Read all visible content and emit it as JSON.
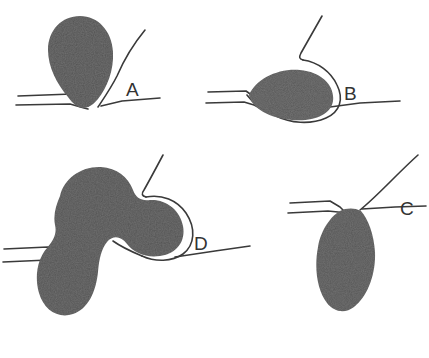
{
  "figure": {
    "background_color": "#ffffff",
    "ink_color": "#2b2b2b",
    "line_color": "#3a3a3a",
    "panels": [
      {
        "id": "panel-a",
        "label": "A",
        "label_x": 126,
        "label_y": 96,
        "description": "Teardrop body above membrane, narrow end contacting a pinched pore"
      },
      {
        "id": "panel-b",
        "label": "B",
        "label_x": 344,
        "label_y": 100,
        "description": "Tilted oval body resting on membrane with curve wrapping its right edge"
      },
      {
        "id": "panel-c",
        "label": "C",
        "label_x": 400,
        "label_y": 215,
        "description": "Teardrop body suspended below the membrane, attached at narrow neck"
      },
      {
        "id": "panel-d",
        "label": "D",
        "label_x": 194,
        "label_y": 250,
        "description": "Three-lobed body spanning the membrane with a central constricted waist"
      }
    ]
  }
}
